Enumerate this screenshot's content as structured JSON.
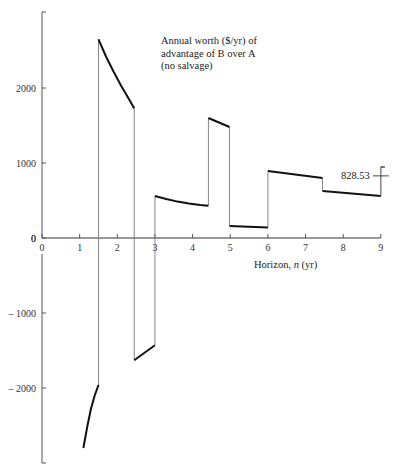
{
  "chart_data": {
    "type": "line",
    "title_lines": [
      "Annual worth ($/yr) of",
      "advantage of B over A",
      "(no salvage)"
    ],
    "xlabel": "Horizon, n (yr)",
    "xlabel_parts": {
      "pre": "Horizon, ",
      "var": "n",
      "post": " (yr)"
    },
    "ylabel": "",
    "xlim": [
      0,
      9
    ],
    "ylim": [
      -2900,
      3000
    ],
    "grid": false,
    "legend": null,
    "x_ticks": [
      0,
      1,
      2,
      3,
      4,
      5,
      6,
      7,
      8,
      9
    ],
    "x_tick_labels": [
      "0",
      "1",
      "2",
      "3",
      "4",
      "5",
      "6",
      "7",
      "8",
      "9"
    ],
    "y_ticks": [
      2000,
      1000,
      0,
      -1000,
      -2000
    ],
    "y_tick_labels": [
      "2000",
      "1000",
      "0",
      "– 1000",
      "– 2000"
    ],
    "series": [
      {
        "name": "Annual worth of advantage of B over A",
        "segments": [
          {
            "x": [
              1.1,
              1.2,
              1.3,
              1.4,
              1.5
            ],
            "y": [
              -2800,
              -2520,
              -2280,
              -2100,
              -1960
            ]
          },
          {
            "x": [
              1.5,
              1.7,
              1.9,
              2.1,
              2.3,
              2.45
            ],
            "y": [
              2650,
              2420,
              2220,
              2030,
              1860,
              1730
            ]
          },
          {
            "x": [
              2.45,
              3.0
            ],
            "y": [
              -1630,
              -1430
            ]
          },
          {
            "x": [
              3.0,
              3.3,
              3.6,
              3.9,
              4.2,
              4.42
            ],
            "y": [
              560,
              520,
              485,
              460,
              440,
              430
            ]
          },
          {
            "x": [
              4.42,
              4.98
            ],
            "y": [
              1600,
              1480
            ]
          },
          {
            "x": [
              4.98,
              6.0
            ],
            "y": [
              160,
              140
            ]
          },
          {
            "x": [
              6.0,
              7.45
            ],
            "y": [
              893,
              800
            ]
          },
          {
            "x": [
              7.45,
              9.0
            ],
            "y": [
              627,
              560
            ]
          }
        ],
        "jumps": [
          {
            "x": 1.5,
            "from": -1960,
            "to": 2650
          },
          {
            "x": 2.45,
            "from": 1730,
            "to": -1630
          },
          {
            "x": 3.0,
            "from": -1430,
            "to": 560
          },
          {
            "x": 4.42,
            "from": 430,
            "to": 1600
          },
          {
            "x": 4.98,
            "from": 1480,
            "to": 160
          },
          {
            "x": 6.0,
            "from": 140,
            "to": 893
          },
          {
            "x": 7.45,
            "from": 800,
            "to": 627
          }
        ]
      }
    ],
    "annotations": [
      {
        "text": "828.53",
        "x": 9,
        "y": 828.53,
        "marker_top": 947
      }
    ]
  }
}
